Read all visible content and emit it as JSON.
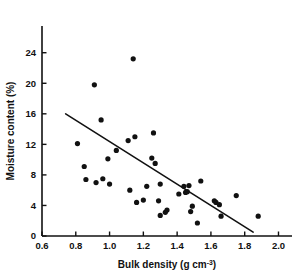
{
  "chart_data": {
    "type": "scatter",
    "title": "",
    "xlabel": "Bulk density (g cm-3)",
    "xlabel_main": "Bulk density (g cm",
    "xlabel_sup": "-3",
    "xlabel_tail": ")",
    "ylabel": "Moisture content (%)",
    "xlim": [
      0.6,
      2.08
    ],
    "ylim": [
      0,
      27.5
    ],
    "xticks": [
      0.6,
      0.8,
      1.0,
      1.2,
      1.4,
      1.6,
      1.8,
      2.0
    ],
    "xtick_labels": [
      "0.6",
      "0.8",
      "1.0",
      "1.2",
      "1.4",
      "1.6",
      "1.8",
      "2.0"
    ],
    "yticks": [
      0,
      4,
      8,
      12,
      16,
      20,
      24
    ],
    "ytick_labels": [
      "0",
      "4",
      "8",
      "12",
      "16",
      "20",
      "24"
    ],
    "grid": false,
    "legend": false,
    "marker": "filled-circle",
    "marker_color": "#111111",
    "marker_size_px": 5.2,
    "points": [
      {
        "x": 0.81,
        "y": 12.1
      },
      {
        "x": 0.85,
        "y": 9.1
      },
      {
        "x": 0.86,
        "y": 7.4
      },
      {
        "x": 0.91,
        "y": 19.8
      },
      {
        "x": 0.92,
        "y": 7.0
      },
      {
        "x": 0.95,
        "y": 15.2
      },
      {
        "x": 0.96,
        "y": 7.5
      },
      {
        "x": 0.99,
        "y": 10.1
      },
      {
        "x": 1.0,
        "y": 6.8
      },
      {
        "x": 1.04,
        "y": 11.2
      },
      {
        "x": 1.11,
        "y": 12.5
      },
      {
        "x": 1.12,
        "y": 6.0
      },
      {
        "x": 1.14,
        "y": 23.2
      },
      {
        "x": 1.15,
        "y": 13.0
      },
      {
        "x": 1.16,
        "y": 4.4
      },
      {
        "x": 1.2,
        "y": 4.7
      },
      {
        "x": 1.22,
        "y": 6.5
      },
      {
        "x": 1.25,
        "y": 10.2
      },
      {
        "x": 1.26,
        "y": 13.5
      },
      {
        "x": 1.27,
        "y": 9.5
      },
      {
        "x": 1.29,
        "y": 4.6
      },
      {
        "x": 1.3,
        "y": 6.8
      },
      {
        "x": 1.3,
        "y": 2.7
      },
      {
        "x": 1.33,
        "y": 3.1
      },
      {
        "x": 1.34,
        "y": 3.4
      },
      {
        "x": 1.41,
        "y": 5.5
      },
      {
        "x": 1.44,
        "y": 6.5
      },
      {
        "x": 1.45,
        "y": 5.7
      },
      {
        "x": 1.46,
        "y": 5.8
      },
      {
        "x": 1.47,
        "y": 6.6
      },
      {
        "x": 1.48,
        "y": 3.2
      },
      {
        "x": 1.49,
        "y": 3.9
      },
      {
        "x": 1.52,
        "y": 1.7
      },
      {
        "x": 1.54,
        "y": 7.2
      },
      {
        "x": 1.62,
        "y": 4.6
      },
      {
        "x": 1.63,
        "y": 4.4
      },
      {
        "x": 1.65,
        "y": 4.1
      },
      {
        "x": 1.66,
        "y": 2.6
      },
      {
        "x": 1.75,
        "y": 5.3
      },
      {
        "x": 1.88,
        "y": 2.6
      }
    ],
    "fit_line": {
      "name": "regression-line",
      "x_start": 0.74,
      "y_start": 16.0,
      "x_end": 1.85,
      "y_end": 0.5,
      "color": "#111111",
      "width_px": 1.6
    }
  }
}
